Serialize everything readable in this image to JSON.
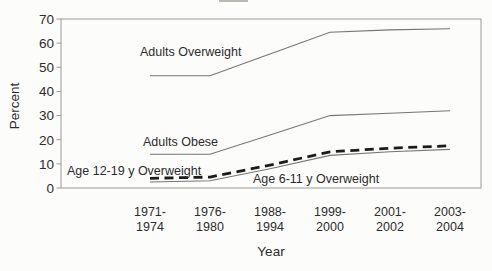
{
  "figure": {
    "background": "#fcfcfa"
  },
  "chart_data": {
    "type": "line",
    "title": "",
    "xlabel": "Year",
    "ylabel": "Percent",
    "ylim": [
      0,
      70
    ],
    "ytick_step": 10,
    "yticks": [
      0,
      10,
      20,
      30,
      40,
      50,
      60,
      70
    ],
    "grid": false,
    "legend_position": "none (series labeled by in-chart text annotations)",
    "categories": [
      "1971-1974",
      "1976-1980",
      "1988-1994",
      "1999-2000",
      "2001-2002",
      "2003-2004"
    ],
    "category_labels_two_line": [
      [
        "1971-",
        "1974"
      ],
      [
        "1976-",
        "1980"
      ],
      [
        "1988-",
        "1994"
      ],
      [
        "1999-",
        "2000"
      ],
      [
        "2001-",
        "2002"
      ],
      [
        "2003-",
        "2004"
      ]
    ],
    "series": [
      {
        "name": "Adults Overweight",
        "values": [
          46.5,
          46.5,
          55.5,
          64.5,
          65.5,
          66
        ],
        "style": "solid-thin",
        "color": "#767676"
      },
      {
        "name": "Adults Obese",
        "values": [
          14,
          14,
          22,
          30,
          31,
          32
        ],
        "style": "solid-thin",
        "color": "#767676"
      },
      {
        "name": "Age 12-19 y Overweight",
        "values": [
          4,
          4.5,
          9.5,
          15,
          16.5,
          17.5
        ],
        "style": "dashed-thick",
        "color": "#1c1c1c"
      },
      {
        "name": "Age 6-11 y Overweight",
        "values": [
          2.5,
          3,
          8,
          13.5,
          15,
          16
        ],
        "style": "solid-thin",
        "color": "#767676"
      }
    ],
    "annotations": [
      {
        "text": "Adults Overweight",
        "x": 140,
        "y": 56
      },
      {
        "text": "Adults Obese",
        "x": 143,
        "y": 146
      },
      {
        "text": "Age 12-19 y Overweight",
        "x": 67,
        "y": 175
      },
      {
        "text": "Age 6-11 y Overweight",
        "x": 253,
        "y": 183
      }
    ],
    "colors": {
      "frame": "#9a9a9a",
      "text": "#2c2c2c",
      "thin_line": "#767676",
      "dashed_line": "#1c1c1c"
    }
  }
}
